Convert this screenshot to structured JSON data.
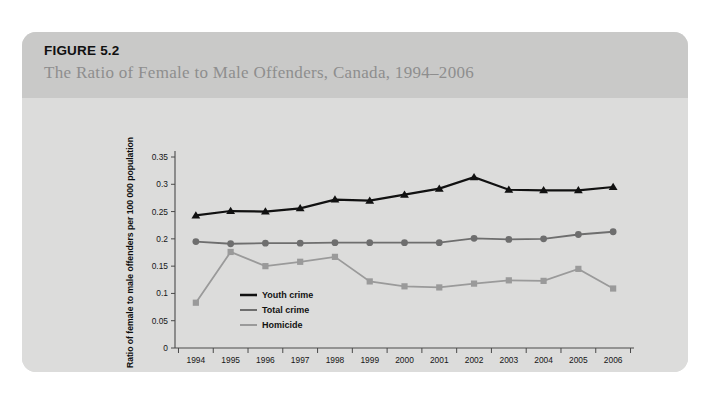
{
  "figure": {
    "number_label": "FIGURE 5.2",
    "title": "The Ratio of Female to Male Offenders, Canada, 1994–2006"
  },
  "colors": {
    "card_background": "#d9d9d8",
    "header_background": "#c9c9c8",
    "body_background": "#dcdcdb",
    "page_background": "#ffffff",
    "youth_crime": "#111111",
    "total_crime": "#6e6e6e",
    "homicide": "#9a9a9a",
    "axis": "#4a4a4a",
    "title_text": "#8e8e8e"
  },
  "chart_data": {
    "type": "line",
    "title": "",
    "xlabel": "Year",
    "ylabel": "Ratio of female to male offenders per 100 000 population",
    "categories": [
      "1994",
      "1995",
      "1996",
      "1997",
      "1998",
      "1999",
      "2000",
      "2001",
      "2002",
      "2003",
      "2004",
      "2005",
      "2006"
    ],
    "x": [
      1994,
      1995,
      1996,
      1997,
      1998,
      1999,
      2000,
      2001,
      2002,
      2003,
      2004,
      2005,
      2006
    ],
    "ylim": [
      0,
      0.35
    ],
    "yticks": [
      "0",
      "0.05",
      "0.1",
      "0.15",
      "0.2",
      "0.25",
      "0.3",
      "0.35"
    ],
    "ytick_values": [
      0,
      0.05,
      0.1,
      0.15,
      0.2,
      0.25,
      0.3,
      0.35
    ],
    "grid": false,
    "legend_position": "inside-lower-left",
    "series": [
      {
        "name": "Youth crime",
        "marker": "triangle",
        "color": "#111111",
        "values": [
          0.243,
          0.251,
          0.25,
          0.256,
          0.272,
          0.27,
          0.281,
          0.292,
          0.313,
          0.29,
          0.289,
          0.289,
          0.295
        ]
      },
      {
        "name": "Total crime",
        "marker": "circle",
        "color": "#6e6e6e",
        "values": [
          0.195,
          0.191,
          0.192,
          0.192,
          0.193,
          0.193,
          0.193,
          0.193,
          0.201,
          0.199,
          0.2,
          0.208,
          0.213
        ]
      },
      {
        "name": "Homicide",
        "marker": "square",
        "color": "#9a9a9a",
        "values": [
          0.083,
          0.176,
          0.15,
          0.158,
          0.167,
          0.122,
          0.113,
          0.111,
          0.118,
          0.124,
          0.123,
          0.145,
          0.109
        ]
      }
    ]
  }
}
